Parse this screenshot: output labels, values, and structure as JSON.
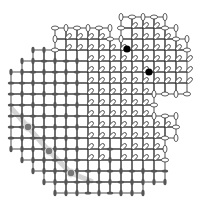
{
  "diagram": {
    "type": "square-lattice-dimer-configuration",
    "pitch": 11,
    "origin": [
      11,
      17
    ],
    "colors": {
      "gridline": "#222222",
      "filled_dimer": "#555555",
      "hollow_dimer_stroke": "#333333",
      "defect_black": "#000000",
      "defect_gray": "#777777",
      "trail": "#cccccc"
    },
    "regions": [
      {
        "name": "left-region",
        "dimer_style": "filled",
        "description": "left / lower octagon-like domain with filled gray dimers"
      },
      {
        "name": "upper-right-region",
        "dimer_style": "hollow",
        "description": "upper-right domain with outlined diagonal dimers"
      }
    ],
    "black_defects": [
      {
        "x": 127,
        "y": 49
      },
      {
        "x": 149,
        "y": 72
      }
    ],
    "gray_defects": [
      {
        "x": 28,
        "y": 127
      },
      {
        "x": 49,
        "y": 151
      },
      {
        "x": 71,
        "y": 173
      }
    ]
  }
}
